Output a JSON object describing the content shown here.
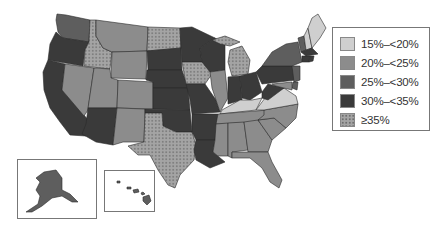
{
  "map": {
    "type": "choropleth",
    "region": "United States",
    "legend": {
      "items": [
        {
          "label": "15%–<20%",
          "color": "#cfcfcf",
          "pattern": "solid"
        },
        {
          "label": "20%–<25%",
          "color": "#8c8c8c",
          "pattern": "solid"
        },
        {
          "label": "25%–<30%",
          "color": "#5e5e5e",
          "pattern": "solid"
        },
        {
          "label": "30%–<35%",
          "color": "#3a3a3a",
          "pattern": "solid"
        },
        {
          "label": "≥35%",
          "color": "#9a9a9a",
          "pattern": "dotted"
        }
      ]
    },
    "insets": [
      "Alaska",
      "Hawaii"
    ],
    "states": {
      "WA": "25%–<30%",
      "OR": "30%–<35%",
      "CA": "30%–<35%",
      "ID": "≥35%",
      "NV": "20%–<25%",
      "MT": "20%–<25%",
      "WY": "20%–<25%",
      "UT": "20%–<25%",
      "CO": "20%–<25%",
      "AZ": "30%–<35%",
      "NM": "20%–<25%",
      "ND": "≥35%",
      "SD": "30%–<35%",
      "NE": "30%–<35%",
      "KS": "30%–<35%",
      "OK": "30%–<35%",
      "TX": "≥35%",
      "MN": "30%–<35%",
      "IA": "≥35%",
      "MO": "30%–<35%",
      "AR": "30%–<35%",
      "LA": "30%–<35%",
      "WI": "30%–<35%",
      "IL": "20%–<25%",
      "MI": "≥35%",
      "IN": "30%–<35%",
      "OH": "30%–<35%",
      "KY": "15%–<20%",
      "TN": "20%–<25%",
      "MS": "20%–<25%",
      "AL": "20%–<25%",
      "GA": "20%–<25%",
      "FL": "20%–<25%",
      "SC": "20%–<25%",
      "NC": "20%–<25%",
      "VA": "15%–<20%",
      "WV": "30%–<35%",
      "PA": "30%–<35%",
      "NY": "25%–<30%",
      "VT": "25%–<30%",
      "NH": "15%–<20%",
      "ME": "15%–<20%",
      "MA": "30%–<35%",
      "CT": "30%–<35%",
      "RI": "30%–<35%",
      "NJ": "25%–<30%",
      "DE": "25%–<30%",
      "MD": "20%–<25%",
      "AK": "25%–<30%",
      "HI": "25%–<30%"
    }
  }
}
